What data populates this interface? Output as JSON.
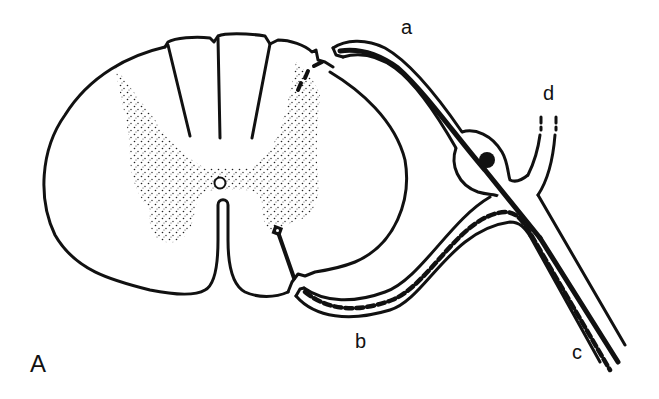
{
  "figure": {
    "panel_label": "A",
    "labels": {
      "a": "a",
      "b": "b",
      "c": "c",
      "d": "d"
    },
    "colors": {
      "ink": "#111111",
      "background": "#ffffff",
      "stipple": "#222222"
    },
    "parts": [
      "spinal-cord-cross-section",
      "gray-matter",
      "central-canal",
      "dorsal-root-a",
      "dorsal-root-ganglion",
      "ventral-root-b",
      "spinal-nerve-c",
      "ramus-d"
    ]
  }
}
